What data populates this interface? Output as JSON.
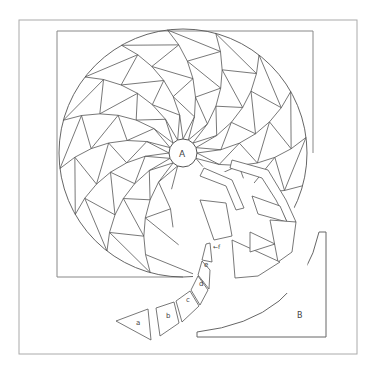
{
  "diagram": {
    "center_label": "A",
    "corner_label": "B",
    "piece_labels": [
      "a",
      "b",
      "c",
      "d",
      "e",
      "f"
    ],
    "f_marker": "←f",
    "colors": {
      "line": "#555555",
      "frame": "#aaaaaa",
      "background": "#ffffff"
    },
    "geometry": {
      "outer_frame": {
        "x": 19,
        "y": 20,
        "w": 338,
        "h": 334
      },
      "block_square": {
        "x": 57,
        "y": 31,
        "w": 256,
        "h": 246
      },
      "circle": {
        "cx": 183,
        "cy": 153,
        "r": 124
      },
      "center_circle": {
        "cx": 183,
        "cy": 153,
        "r": 14
      },
      "rings": 6,
      "petals": 16
    }
  }
}
